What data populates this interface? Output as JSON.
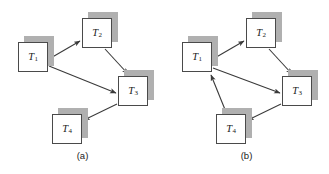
{
  "figure": {
    "width": 329,
    "height": 174,
    "background": "#ffffff",
    "node_border_color": "#4a4a4a",
    "node_fill_color": "#ffffff",
    "node_shadow_color": "#b0b0b0",
    "edge_color": "#3a3a3a"
  },
  "panels": [
    {
      "id": "a",
      "caption": "(a)",
      "nodes": [
        {
          "id": "T1",
          "label": "T",
          "sub": "1",
          "x": 18,
          "y": 42,
          "shadow_dx": 6,
          "shadow_dy": -6
        },
        {
          "id": "T2",
          "label": "T",
          "sub": "2",
          "x": 82,
          "y": 18,
          "shadow_dx": 6,
          "shadow_dy": -6
        },
        {
          "id": "T3",
          "label": "T",
          "sub": "3",
          "x": 118,
          "y": 76,
          "shadow_dx": 6,
          "shadow_dy": -6
        },
        {
          "id": "T4",
          "label": "T",
          "sub": "4",
          "x": 52,
          "y": 114,
          "shadow_dx": 6,
          "shadow_dy": -6
        }
      ],
      "edges": [
        {
          "from": "T1",
          "to": "T2",
          "x1": 49,
          "y1": 59,
          "x2": 80,
          "y2": 41
        },
        {
          "from": "T1",
          "to": "T3",
          "x1": 49,
          "y1": 66,
          "x2": 116,
          "y2": 93
        },
        {
          "from": "T2",
          "to": "T3",
          "x1": 105,
          "y1": 49,
          "x2": 128,
          "y2": 74
        },
        {
          "from": "T3",
          "to": "T4",
          "x1": 117,
          "y1": 104,
          "x2": 84,
          "y2": 120
        }
      ]
    },
    {
      "id": "b",
      "caption": "(b)",
      "nodes": [
        {
          "id": "T1",
          "label": "T",
          "sub": "1",
          "x": 18,
          "y": 42,
          "shadow_dx": 6,
          "shadow_dy": -6
        },
        {
          "id": "T2",
          "label": "T",
          "sub": "2",
          "x": 82,
          "y": 18,
          "shadow_dx": 6,
          "shadow_dy": -6
        },
        {
          "id": "T3",
          "label": "T",
          "sub": "3",
          "x": 118,
          "y": 76,
          "shadow_dx": 6,
          "shadow_dy": -6
        },
        {
          "id": "T4",
          "label": "T",
          "sub": "4",
          "x": 52,
          "y": 114,
          "shadow_dx": 6,
          "shadow_dy": -6
        }
      ],
      "edges": [
        {
          "from": "T1",
          "to": "T2",
          "x1": 49,
          "y1": 59,
          "x2": 80,
          "y2": 41
        },
        {
          "from": "T1",
          "to": "T3",
          "x1": 49,
          "y1": 68,
          "x2": 116,
          "y2": 93
        },
        {
          "from": "T2",
          "to": "T3",
          "x1": 105,
          "y1": 49,
          "x2": 128,
          "y2": 74
        },
        {
          "from": "T3",
          "to": "T4",
          "x1": 117,
          "y1": 104,
          "x2": 84,
          "y2": 120
        },
        {
          "from": "T4",
          "to": "T1",
          "x1": 62,
          "y1": 112,
          "x2": 47,
          "y2": 75
        }
      ]
    }
  ]
}
